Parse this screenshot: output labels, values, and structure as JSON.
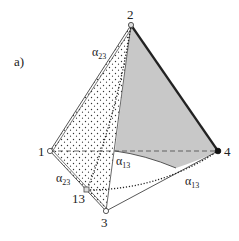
{
  "figure": {
    "panel_label": "a)",
    "vertices": {
      "v1": {
        "label": "1",
        "x": 50,
        "y": 151
      },
      "v2": {
        "label": "2",
        "x": 131,
        "y": 25
      },
      "v3": {
        "label": "3",
        "x": 106,
        "y": 211
      },
      "v4": {
        "label": "4",
        "x": 218,
        "y": 151
      },
      "v13": {
        "label": "13",
        "x": 87,
        "y": 190
      }
    },
    "edge_labels": {
      "alpha23_top": {
        "symbol": "α",
        "sub": "23"
      },
      "alpha23_bottom": {
        "symbol": "α",
        "sub": "23"
      },
      "alpha13_inner": {
        "symbol": "α",
        "sub": "13"
      },
      "alpha13_right": {
        "symbol": "α",
        "sub": "13"
      }
    },
    "colors": {
      "shaded_face": "#c8c8c8",
      "edge": "#444444",
      "thick_edge": "#222222"
    }
  }
}
